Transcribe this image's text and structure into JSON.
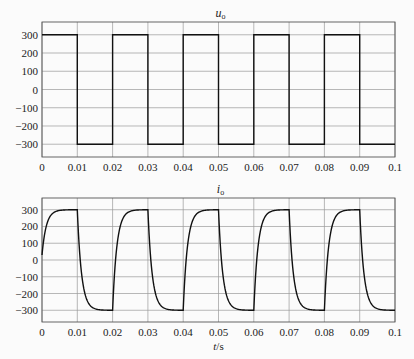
{
  "chart_data": [
    {
      "type": "line",
      "title": "u_o",
      "title_main": "u",
      "title_sub": "o",
      "xlabel": "",
      "ylabel": "",
      "xlim": [
        0,
        0.1
      ],
      "ylim": [
        -370,
        370
      ],
      "grid": true,
      "x_ticks": [
        "0",
        "0.01",
        "0.02",
        "0.03",
        "0.04",
        "0.05",
        "0.06",
        "0.07",
        "0.08",
        "0.09",
        "0.1"
      ],
      "y_ticks": [
        "300",
        "200",
        "100",
        "0",
        "−100",
        "−200",
        "−300"
      ],
      "series": [
        {
          "name": "u_o (square wave)",
          "shape": "square",
          "amplitude": 300,
          "period": 0.02,
          "x": [
            0,
            0.01,
            0.01,
            0.02,
            0.02,
            0.03,
            0.03,
            0.04,
            0.04,
            0.05,
            0.05,
            0.06,
            0.06,
            0.07,
            0.07,
            0.08,
            0.08,
            0.09,
            0.09,
            0.1
          ],
          "values": [
            300,
            300,
            -300,
            -300,
            300,
            300,
            -300,
            -300,
            300,
            300,
            -300,
            -300,
            300,
            300,
            -300,
            -300,
            300,
            300,
            -300,
            -300
          ]
        }
      ]
    },
    {
      "type": "line",
      "title": "i_o",
      "title_main": "i",
      "title_sub": "o",
      "xlabel": "t/s",
      "xlabel_main": "t",
      "xlabel_unit": "/s",
      "ylabel": "",
      "xlim": [
        0,
        0.1
      ],
      "ylim": [
        -370,
        370
      ],
      "grid": true,
      "x_ticks": [
        "0",
        "0.01",
        "0.02",
        "0.03",
        "0.04",
        "0.05",
        "0.06",
        "0.07",
        "0.08",
        "0.09",
        "0.1"
      ],
      "y_ticks": [
        "300",
        "200",
        "100",
        "0",
        "−100",
        "−200",
        "−300"
      ],
      "series": [
        {
          "name": "i_o (exponential response)",
          "shape": "rl-response",
          "amplitude": 300,
          "period": 0.02,
          "time_constant": 0.0012,
          "initial_value": 30,
          "x": [
            0,
            0.002,
            0.005,
            0.01,
            0.012,
            0.015,
            0.02,
            0.022,
            0.025,
            0.03
          ],
          "values": [
            30,
            250,
            298,
            300,
            -250,
            -298,
            -300,
            250,
            298,
            300
          ]
        }
      ]
    }
  ]
}
